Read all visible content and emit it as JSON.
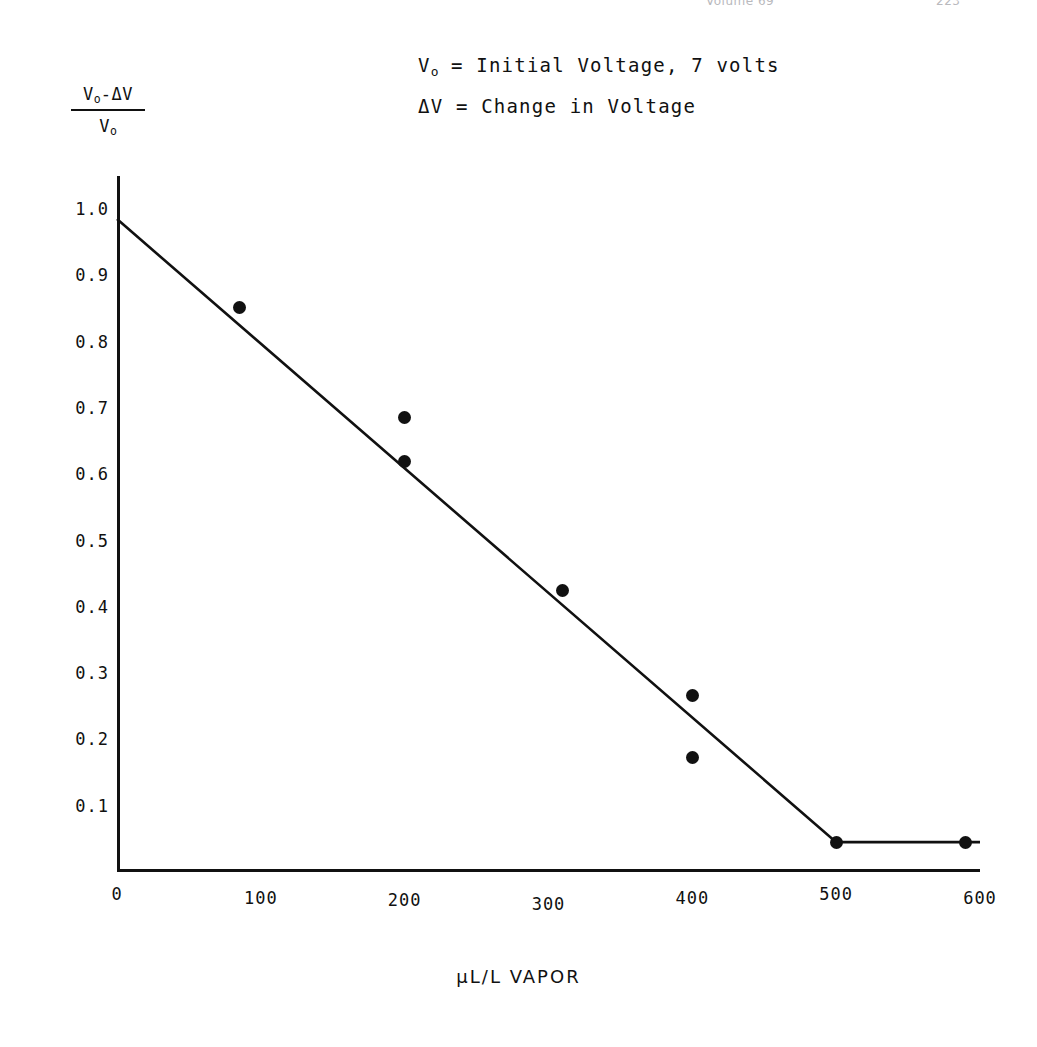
{
  "running_head": {
    "volume": "Volume 69",
    "page": "223"
  },
  "annotations": [
    "V₀ = Initial Voltage, 7 volts",
    "ΔV = Change in Voltage"
  ],
  "annotation_parts": {
    "line1_prefix": "V",
    "line1_sub": "o",
    "line1_rest": " = Initial Voltage, 7 volts",
    "line2": "ΔV = Change in Voltage"
  },
  "y_axis_label": {
    "numerator_prefix": "V",
    "numerator_sub": "o",
    "numerator_rest": "-ΔV",
    "denominator_prefix": "V",
    "denominator_sub": "o"
  },
  "chart_data": {
    "type": "scatter",
    "title": "",
    "xlabel": "μL/L VAPOR",
    "ylabel": "(V₀-ΔV)/V₀",
    "xlim": [
      0,
      600
    ],
    "ylim": [
      0,
      1.05
    ],
    "grid": false,
    "legend_position": "top-center",
    "xticks": [
      0,
      100,
      200,
      300,
      400,
      500,
      600
    ],
    "xtick_labels": [
      "0",
      "100",
      "200",
      "300",
      "400",
      "500",
      "600"
    ],
    "yticks": [
      0.1,
      0.2,
      0.3,
      0.4,
      0.5,
      0.6,
      0.7,
      0.8,
      0.9,
      1.0
    ],
    "ytick_labels": [
      "0.1",
      "0.2",
      "0.3",
      "0.4",
      "0.5",
      "0.6",
      "0.7",
      "0.8",
      "0.9",
      "1.0"
    ],
    "series": [
      {
        "name": "measured points",
        "marker": "filled-circle",
        "color": "#111111",
        "points": [
          {
            "x": 85,
            "y": 0.852
          },
          {
            "x": 200,
            "y": 0.685
          },
          {
            "x": 200,
            "y": 0.62
          },
          {
            "x": 310,
            "y": 0.425
          },
          {
            "x": 400,
            "y": 0.267
          },
          {
            "x": 400,
            "y": 0.172
          },
          {
            "x": 500,
            "y": 0.045
          },
          {
            "x": 590,
            "y": 0.045
          }
        ]
      },
      {
        "name": "fitted line",
        "type": "line",
        "color": "#111111",
        "points": [
          {
            "x": 0,
            "y": 0.985
          },
          {
            "x": 500,
            "y": 0.045
          },
          {
            "x": 600,
            "y": 0.045
          }
        ]
      }
    ]
  }
}
